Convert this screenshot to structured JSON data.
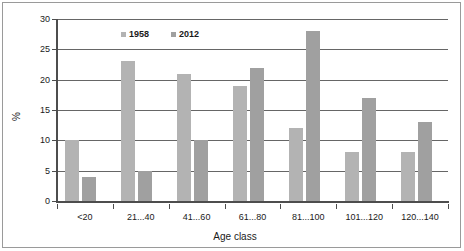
{
  "chart_data": {
    "type": "bar",
    "title": "",
    "subtitle": "",
    "xlabel": "Age class",
    "ylabel": "%",
    "categories": [
      "<20",
      "21...40",
      "41...60",
      "61...80",
      "81...100",
      "101...120",
      "120...140"
    ],
    "series": [
      {
        "name": "1958",
        "values": [
          10,
          23,
          21,
          19,
          12,
          8,
          8
        ],
        "color": "#b3b3b3"
      },
      {
        "name": "2012",
        "values": [
          4,
          5,
          10,
          22,
          28,
          17,
          13
        ],
        "color": "#a0a0a0"
      }
    ],
    "ylim": [
      0,
      30
    ],
    "yticks": [
      0,
      5,
      10,
      15,
      20,
      25,
      30
    ],
    "ytick_labels": [
      "0",
      "5",
      "10",
      "15",
      "20",
      "25",
      "30"
    ],
    "grid": true,
    "grid_axis": "y",
    "legend_position": "upper-left-inside",
    "frame": true,
    "background": "#ffffff",
    "axis_color": "#4d4d4d",
    "grid_color": "#666666",
    "text_color": "#1a1a1a"
  }
}
